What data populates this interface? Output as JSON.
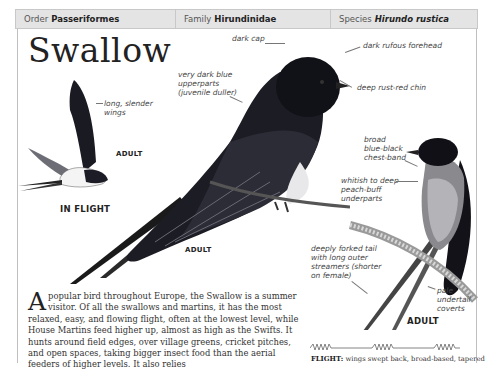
{
  "header": {
    "order_label": "Order",
    "order_value": "Passeriformes",
    "family_label": "Family",
    "family_value": "Hirundinidae",
    "species_label": "Species",
    "species_value": "Hirundo rustica"
  },
  "title": "Swallow",
  "annotations": {
    "dark_cap": "dark cap",
    "dark_rufous_forehead": "dark rufous forehead",
    "deep_rust_red_chin": "deep rust-red chin",
    "upperparts_line1": "very dark blue",
    "upperparts_line2": "upperparts",
    "upperparts_line3": "(juvenile duller)",
    "wings_line1": "long, slender",
    "wings_line2": "wings",
    "chest_band_line1": "broad",
    "chest_band_line2": "blue-black",
    "chest_band_line3": "chest-band",
    "underparts_line1": "whitish to deep",
    "underparts_line2": "peach-buff",
    "underparts_line3": "underparts",
    "tail_line1": "deeply forked tail",
    "tail_line2": "with long outer",
    "tail_line3": "streamers (shorter",
    "tail_line4": "on female)",
    "undertail_line1": "pale",
    "undertail_line2": "undertail",
    "undertail_line3": "coverts"
  },
  "labels": {
    "flight_adult": "ADULT",
    "in_flight": "IN FLIGHT",
    "main_adult": "ADULT",
    "perched_adult": "ADULT"
  },
  "body": {
    "dropcap": "A",
    "text": " popular bird throughout Europe, the Swallow is a summer visitor. Of all the swallows and martins, it has the most relaxed, easy, and flowing flight, often at the lowest level, while House Martins feed higher up, almost as high as the Swifts. It hunts around field edges, over village greens, cricket pitches, and open spaces, taking bigger insect food than the aerial feeders of higher levels. It also relies"
  },
  "flight": {
    "label": "FLIGHT:",
    "text": " wings swept back, broad-based, tapered"
  }
}
